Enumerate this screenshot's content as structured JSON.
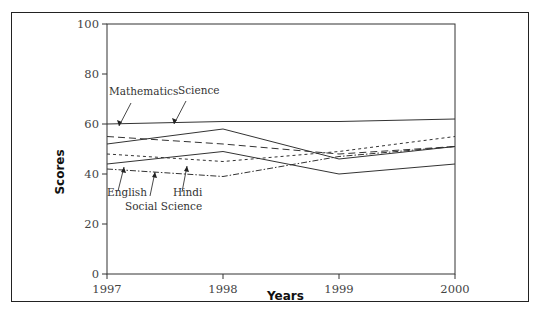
{
  "chart_data": {
    "type": "line",
    "title": "",
    "xlabel": "Years",
    "ylabel": "Scores",
    "x": [
      "1997",
      "1998",
      "1999",
      "2000"
    ],
    "ylim": [
      0,
      100
    ],
    "yticks": [
      "0",
      "20",
      "40",
      "60",
      "80",
      "100"
    ],
    "grid": false,
    "legend": "inline annotations with arrows",
    "series": [
      {
        "name": "Mathematics",
        "style": "long-dash",
        "values": [
          55,
          52,
          48,
          51
        ]
      },
      {
        "name": "Science",
        "style": "solid",
        "values": [
          52,
          58,
          46,
          51
        ]
      },
      {
        "name": "English",
        "style": "solid",
        "values": [
          44,
          49,
          40,
          44
        ]
      },
      {
        "name": "Hindi",
        "style": "short-dash",
        "values": [
          48,
          45,
          49,
          55
        ]
      },
      {
        "name": "Social Science",
        "style": "dash-dot",
        "values": [
          42,
          39,
          47,
          51
        ]
      },
      {
        "name": "",
        "style": "solid",
        "values": [
          60,
          61,
          61,
          62
        ]
      }
    ],
    "annotations": [
      "Mathematics",
      "Science",
      "English",
      "Social Science",
      "Hindi"
    ]
  }
}
